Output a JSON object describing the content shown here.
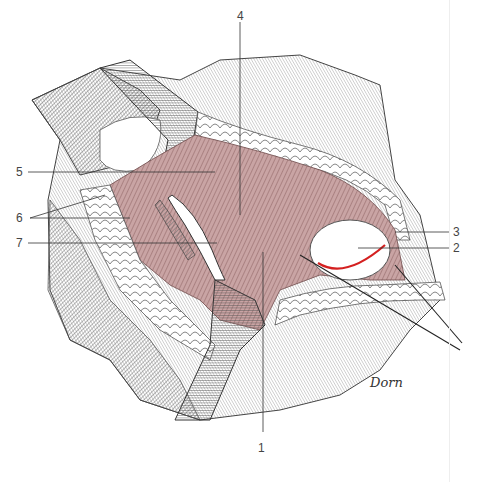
{
  "figure": {
    "type": "surgical anatomical illustration",
    "signature": "Dorn",
    "colors": {
      "muscle": "#b89090",
      "muscle_dark": "#8c6666",
      "hatch": "#555555",
      "incision": "#d42020",
      "leader": "#333333"
    },
    "labels": [
      {
        "id": "1",
        "text": "1",
        "x": 261,
        "y": 440
      },
      {
        "id": "2",
        "text": "2",
        "x": 453,
        "y": 243
      },
      {
        "id": "3",
        "text": "3",
        "x": 453,
        "y": 227
      },
      {
        "id": "4",
        "text": "4",
        "x": 237,
        "y": 10
      },
      {
        "id": "5",
        "text": "5",
        "x": 16,
        "y": 166
      },
      {
        "id": "6",
        "text": "6",
        "x": 16,
        "y": 212
      },
      {
        "id": "7",
        "text": "7",
        "x": 16,
        "y": 237
      }
    ]
  }
}
